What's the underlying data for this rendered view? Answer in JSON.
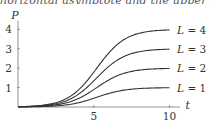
{
  "caption_fragment": "horizontal asymptote and the upper bound",
  "chart_data": {
    "type": "line",
    "title": "",
    "xlabel": "t",
    "ylabel": "P",
    "xlim": [
      0,
      10.5
    ],
    "ylim": [
      0,
      4.4
    ],
    "x_ticks": [
      5,
      10
    ],
    "x_tick_labels": [
      "5",
      "10"
    ],
    "y_ticks": [
      1,
      2,
      3,
      4
    ],
    "y_tick_labels": [
      "1",
      "2",
      "3",
      "4"
    ],
    "grid": false,
    "legend_position": "inline-right",
    "x": [
      0,
      1,
      2,
      3,
      4,
      5,
      6,
      7,
      8,
      9,
      10
    ],
    "series": [
      {
        "name": "L = 4",
        "L": 4,
        "values": [
          0.02,
          0.06,
          0.16,
          0.42,
          0.98,
          1.86,
          2.78,
          3.39,
          3.72,
          3.88,
          3.95
        ]
      },
      {
        "name": "L = 3",
        "L": 3,
        "values": [
          0.02,
          0.05,
          0.13,
          0.32,
          0.74,
          1.4,
          2.08,
          2.54,
          2.79,
          2.91,
          2.96
        ]
      },
      {
        "name": "L = 2",
        "L": 2,
        "values": [
          0.01,
          0.03,
          0.08,
          0.21,
          0.49,
          0.93,
          1.39,
          1.69,
          1.86,
          1.94,
          1.98
        ]
      },
      {
        "name": "L = 1",
        "L": 1,
        "values": [
          0.01,
          0.02,
          0.04,
          0.11,
          0.25,
          0.47,
          0.7,
          0.85,
          0.93,
          0.97,
          0.99
        ]
      }
    ],
    "line_color": "#333333"
  },
  "axes": {
    "x_label": "t",
    "y_label": "P",
    "x_tick_labels": [
      "5",
      "10"
    ],
    "y_tick_labels": [
      "1",
      "2",
      "3",
      "4"
    ]
  },
  "legend": [
    "L = 4",
    "L = 3",
    "L = 2",
    "L = 1"
  ]
}
